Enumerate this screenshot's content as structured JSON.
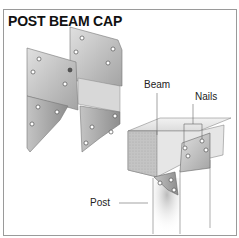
{
  "title": "POST BEAM CAP",
  "labels": {
    "beam": "Beam",
    "nails": "Nails",
    "post": "Post"
  },
  "colors": {
    "metal_light": "#d2d2d2",
    "metal_dark": "#a8a8a8",
    "wood_end": "#c8c8c8",
    "wood_face": "#e8e8e8",
    "border": "#9a9a9a"
  }
}
